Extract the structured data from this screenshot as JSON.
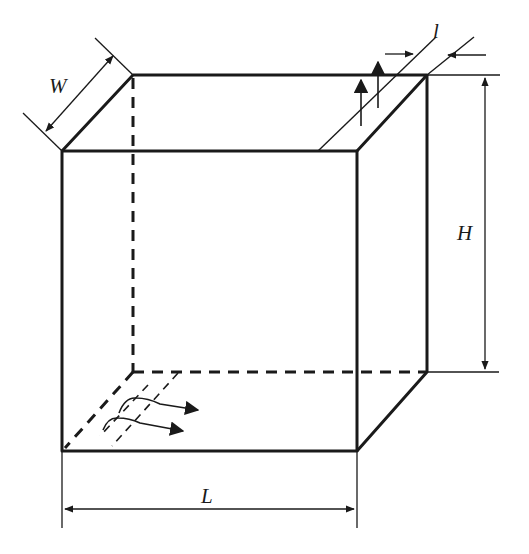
{
  "diagram": {
    "type": "isometric box with dimension annotations",
    "labels": {
      "width": "W",
      "height": "H",
      "length": "L",
      "slot": "l"
    },
    "colors": {
      "stroke": "#1a1a1a",
      "background": "#ffffff"
    },
    "elements": [
      "front face (solid)",
      "top face (solid)",
      "right face (solid)",
      "hidden back edges (dashed)",
      "inlet flow arrows at bottom-left",
      "outlet slot with upward flow arrows at top-right",
      "dimension arrows W, H, L, l"
    ]
  }
}
